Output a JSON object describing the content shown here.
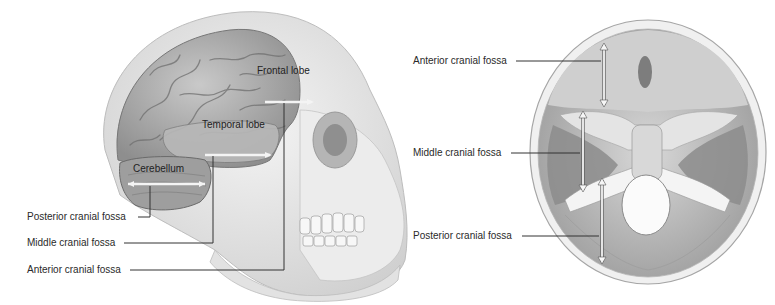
{
  "lateral_view": {
    "structures": {
      "frontal_lobe": "Frontal lobe",
      "temporal_lobe": "Temporal lobe",
      "cerebellum": "Cerebellum"
    },
    "callouts": [
      {
        "label": "Posterior cranial fossa"
      },
      {
        "label": "Middle cranial fossa"
      },
      {
        "label": "Anterior cranial fossa"
      }
    ]
  },
  "superior_view": {
    "callouts": [
      {
        "label": "Anterior cranial fossa"
      },
      {
        "label": "Middle cranial fossa"
      },
      {
        "label": "Posterior cranial fossa"
      }
    ]
  },
  "colors": {
    "leader_line": "#333333",
    "bone": "#e6e6e6",
    "brain": "#a9a9a9",
    "arrow": "#f2f2f2"
  }
}
